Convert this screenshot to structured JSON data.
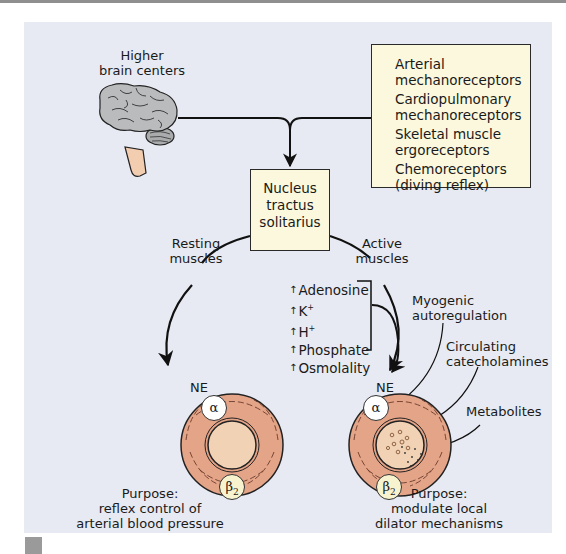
{
  "diagram": {
    "higher_brain": {
      "line1": "Higher",
      "line2": "brain centers"
    },
    "receptors_box": {
      "items": [
        "Arterial",
        "mechanoreceptors",
        "Cardiopulmonary",
        "mechanoreceptors",
        "Skeletal muscle",
        "ergoreceptors",
        "Chemoreceptors",
        "(diving reflex)"
      ]
    },
    "nucleus_box": {
      "lines": [
        "Nucleus",
        "tractus",
        "solitarius"
      ]
    },
    "resting_muscles": {
      "line1": "Resting",
      "line2": "muscles"
    },
    "active_muscles": {
      "line1": "Active",
      "line2": "muscles"
    },
    "metabolites_list": {
      "arrow": "↑",
      "items": [
        "Adenosine",
        "K",
        "H",
        "Phosphate",
        "Osmolality"
      ],
      "superscripts": [
        "",
        "+",
        "+",
        "",
        ""
      ]
    },
    "local_factors": {
      "myogenic": {
        "line1": "Myogenic",
        "line2": "autoregulation"
      },
      "catecholamines": {
        "line1": "Circulating",
        "line2": "catecholamines"
      },
      "metabolites": "Metabolites"
    },
    "left_vessel": {
      "ne_label": "NE",
      "alpha_label": "α",
      "beta_label": "β",
      "beta_sub": "2",
      "purpose": {
        "line1": "Purpose:",
        "line2": "reflex control of",
        "line3": "arterial blood pressure"
      }
    },
    "right_vessel": {
      "ne_label": "NE",
      "alpha_label": "α",
      "beta_label": "β",
      "beta_sub": "2",
      "purpose": {
        "line1": "Purpose:",
        "line2": "modulate local",
        "line3": "dilator mechanisms"
      }
    },
    "colors": {
      "panel_bg": "#e7eaf2",
      "box_fill": "#fbf8dd",
      "vessel_outer": "#e4a488",
      "vessel_inner": "#f1d2b4",
      "brain_gray": "#b9bbbd",
      "brainstem": "#f2cdb0",
      "line": "#111111"
    }
  }
}
